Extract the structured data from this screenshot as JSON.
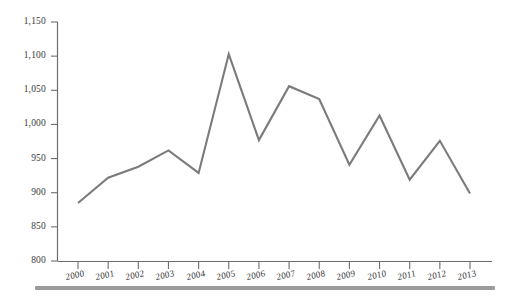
{
  "chart_data": {
    "type": "line",
    "title": "",
    "subtitle": "",
    "xlabel": "",
    "ylabel": "",
    "categories": [
      "2000",
      "2001",
      "2002",
      "2003",
      "2004",
      "2005",
      "2006",
      "2007",
      "2008",
      "2009",
      "2010",
      "2011",
      "2012",
      "2013"
    ],
    "values": [
      885,
      922,
      938,
      962,
      929,
      1103,
      977,
      1056,
      1037,
      941,
      1013,
      919,
      976,
      899
    ],
    "series": [
      {
        "name": "",
        "values": [
          885,
          922,
          938,
          962,
          929,
          1103,
          977,
          1056,
          1037,
          941,
          1013,
          919,
          976,
          899
        ]
      }
    ],
    "ylim": [
      800,
      1150
    ],
    "ytick_labels": [
      "800",
      "850",
      "900",
      "950",
      "1,000",
      "1,050",
      "1,100",
      "1,150"
    ],
    "ytick_values": [
      800,
      850,
      900,
      950,
      1000,
      1050,
      1100,
      1150
    ],
    "xtick_labels": [
      "2000",
      "2001",
      "2002",
      "2003",
      "2004",
      "2005",
      "2006",
      "2007",
      "2008",
      "2009",
      "2010",
      "2011",
      "2012",
      "2013"
    ],
    "grid": false,
    "legend": "none",
    "line_color": "#7b7b7b",
    "axis_color": "#6e6e6e",
    "text_color": "#3a3a3a",
    "background_color": "#ffffff",
    "rule_color": "#9b9b9b"
  }
}
